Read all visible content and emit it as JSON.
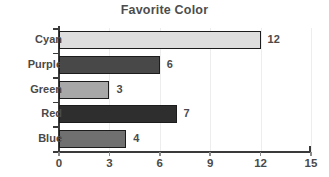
{
  "chart_data": {
    "type": "bar",
    "orientation": "horizontal",
    "title": "Favorite Color",
    "xlabel": "",
    "ylabel": "",
    "categories": [
      "Cyan",
      "Purple",
      "Green",
      "Red",
      "Blue"
    ],
    "values": [
      12,
      6,
      3,
      7,
      4
    ],
    "value_labels": [
      "12",
      "6",
      "3",
      "7",
      "4"
    ],
    "bar_colors": [
      "#dedede",
      "#484848",
      "#a8a8a8",
      "#2e2e2e",
      "#707070"
    ],
    "bar_edge_color": "#1c1c1c",
    "xlim": [
      0,
      15
    ],
    "xticks": [
      0,
      3,
      6,
      9,
      12,
      15
    ],
    "xtick_labels": [
      "0",
      "3",
      "6",
      "9",
      "12",
      "15"
    ],
    "grid": true,
    "grid_color": "#ededed",
    "legend": null,
    "background": "#ffffff",
    "text_color": "#4a4a4a",
    "title_color": "#4d4d4d",
    "axis_color": "#3a3a3a"
  }
}
